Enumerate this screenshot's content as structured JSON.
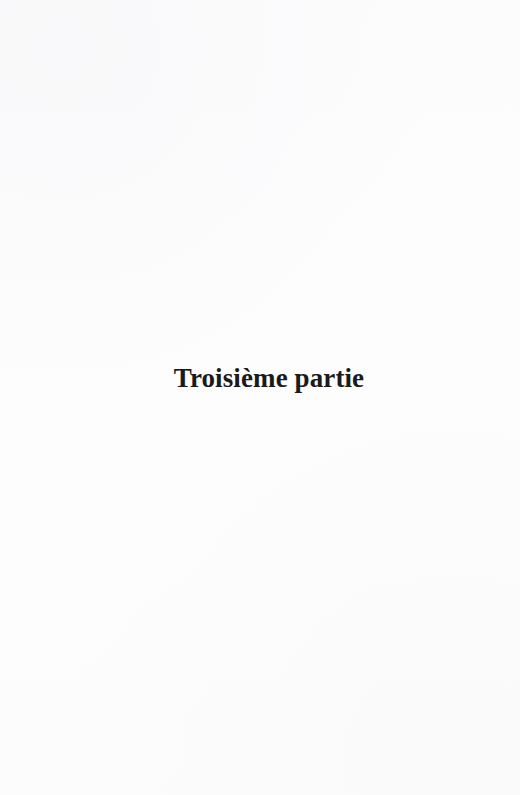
{
  "document": {
    "type": "book-part-divider-page",
    "language": "fr",
    "page_background_color": "#fdfdfd",
    "text_color": "#1a1a1a"
  },
  "page": {
    "part_title": "Troisième partie",
    "header": "",
    "footer": "",
    "page_number": "",
    "body_text": ""
  }
}
